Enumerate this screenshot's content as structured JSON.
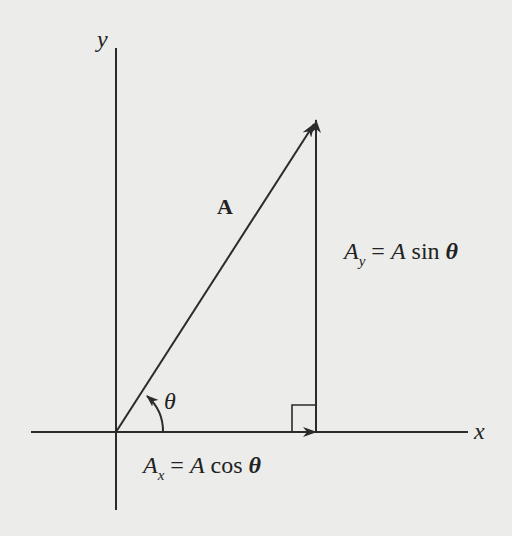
{
  "diagram": {
    "type": "vector-components",
    "axes": {
      "x_label": "x",
      "y_label": "y"
    },
    "vector": {
      "label": "A",
      "angle_label": "θ"
    },
    "components": {
      "x": {
        "lhs": "A",
        "sub": "x",
        "eq": "=",
        "rhs_var": "A",
        "fn": "cos",
        "angle": "θ"
      },
      "y": {
        "lhs": "A",
        "sub": "y",
        "eq": "=",
        "rhs_var": "A",
        "fn": "sin",
        "angle": "θ"
      }
    },
    "colors": {
      "line": "#2b2b2b",
      "background": "#ececea"
    }
  }
}
